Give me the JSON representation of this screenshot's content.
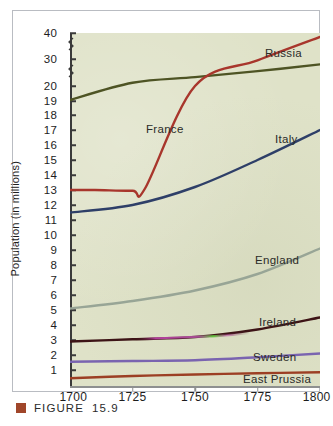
{
  "figure": {
    "caption_label": "FIGURE",
    "caption_number": "15.9",
    "caption_swatch_color": "#a0462a"
  },
  "chart_data": {
    "type": "line",
    "title": "",
    "subtitle": "",
    "xlabel": "",
    "ylabel": "Population (in millions)",
    "grid": false,
    "legend_position": "inline-labels",
    "x": [
      1700,
      1725,
      1750,
      1775,
      1800
    ],
    "xlim": [
      1700,
      1800
    ],
    "xtick_labels": [
      "1700",
      "1725",
      "1750",
      "1775",
      "1800"
    ],
    "ytick_labels": [
      "40",
      "30",
      "20",
      "19",
      "18",
      "17",
      "16",
      "15",
      "14",
      "13",
      "12",
      "11",
      "10",
      "9",
      "8",
      "7",
      "6",
      "5",
      "4",
      "3",
      "2",
      "1"
    ],
    "y_axis_note": "broken axis: compressed between 20 and 30 and between 30 and 40",
    "ylim": [
      0,
      40
    ],
    "series": [
      {
        "name": "Russia",
        "color": "#4e5424",
        "label_x": 252,
        "label_y": 36,
        "points": [
          [
            1700,
            19.0
          ],
          [
            1725,
            21.2
          ],
          [
            1750,
            23.3
          ],
          [
            1775,
            25.5
          ],
          [
            1800,
            28.0
          ]
        ]
      },
      {
        "name": "France",
        "color": "#a8362c",
        "label_x": 133,
        "label_y": 112,
        "points": [
          [
            1700,
            13.0
          ],
          [
            1710,
            13.0
          ],
          [
            1725,
            12.95
          ],
          [
            1730,
            13.1
          ],
          [
            1750,
            20.0
          ],
          [
            1775,
            29.5
          ],
          [
            1800,
            38.5
          ]
        ]
      },
      {
        "name": "Italy",
        "color": "#2e3f68",
        "label_x": 262,
        "label_y": 122,
        "points": [
          [
            1700,
            11.5
          ],
          [
            1725,
            12.0
          ],
          [
            1750,
            13.2
          ],
          [
            1775,
            15.0
          ],
          [
            1800,
            17.0
          ]
        ]
      },
      {
        "name": "England",
        "color": "#98a596",
        "label_x": 242,
        "label_y": 243,
        "points": [
          [
            1700,
            5.1
          ],
          [
            1725,
            5.6
          ],
          [
            1750,
            6.3
          ],
          [
            1775,
            7.4
          ],
          [
            1800,
            9.1
          ]
        ]
      },
      {
        "name": "Ireland",
        "color": "#3d1416",
        "label_x": 246,
        "label_y": 305,
        "points": [
          [
            1700,
            2.9
          ],
          [
            1725,
            3.05
          ],
          [
            1750,
            3.2
          ],
          [
            1775,
            3.7
          ],
          [
            1800,
            4.5
          ]
        ]
      },
      {
        "name": "Sweden",
        "color": "#7a64b0",
        "label_x": 240,
        "label_y": 340,
        "points": [
          [
            1700,
            1.55
          ],
          [
            1725,
            1.6
          ],
          [
            1750,
            1.65
          ],
          [
            1775,
            1.85
          ],
          [
            1800,
            2.1
          ]
        ]
      },
      {
        "name": "East Prussia",
        "color": "#9c3f24",
        "label_x": 230,
        "label_y": 362,
        "points": [
          [
            1700,
            0.45
          ],
          [
            1725,
            0.6
          ],
          [
            1750,
            0.7
          ],
          [
            1775,
            0.78
          ],
          [
            1800,
            0.85
          ]
        ]
      }
    ]
  }
}
